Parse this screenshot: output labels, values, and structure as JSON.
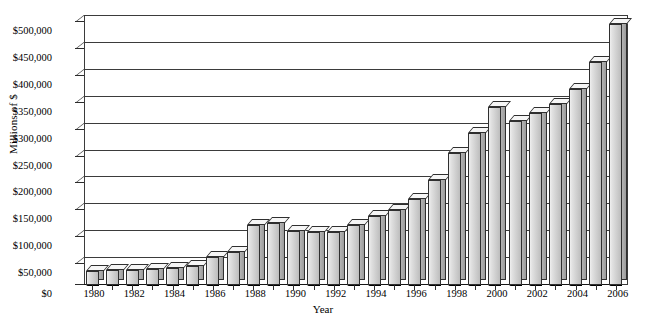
{
  "chart_data": {
    "type": "bar",
    "title": "",
    "xlabel": "Year",
    "ylabel": "Millions of $",
    "ylim": [
      0,
      500000
    ],
    "ytick_step": 50000,
    "grid": true,
    "legend": null,
    "style": "3d-column",
    "ytick_labels": [
      "$0",
      "$50,000",
      "$100,000",
      "$150,000",
      "$200,000",
      "$250,000",
      "$300,000",
      "$350,000",
      "$400,000",
      "$450,000",
      "$500,000"
    ],
    "ytick_values": [
      0,
      50000,
      100000,
      150000,
      200000,
      250000,
      300000,
      350000,
      400000,
      450000,
      500000
    ],
    "xtick_labels": [
      "1980",
      "1982",
      "1984",
      "1986",
      "1988",
      "1990",
      "1992",
      "1994",
      "1996",
      "1998",
      "2000",
      "2002",
      "2004",
      "2006"
    ],
    "categories": [
      "1980",
      "1981",
      "1982",
      "1983",
      "1984",
      "1985",
      "1986",
      "1987",
      "1988",
      "1989",
      "1990",
      "1991",
      "1992",
      "1993",
      "1994",
      "1995",
      "1996",
      "1997",
      "1998",
      "1999",
      "2000",
      "2001",
      "2002",
      "2003",
      "2004",
      "2005",
      "2006"
    ],
    "values": [
      26000,
      27000,
      28000,
      29000,
      32000,
      36000,
      52000,
      62000,
      112000,
      115000,
      100000,
      99000,
      98000,
      112000,
      128000,
      140000,
      160000,
      195000,
      245000,
      282000,
      330000,
      305000,
      320000,
      337000,
      365000,
      415000,
      485000
    ],
    "colors": {
      "bar_front": "#cfcfcf",
      "bar_top": "#f6f6f6",
      "bar_side": "#9b9b9b",
      "bar_base_shadow": "#000000",
      "axis": "#2b2b2b",
      "gridline": "#3b3b3b",
      "background": "#ffffff"
    }
  }
}
